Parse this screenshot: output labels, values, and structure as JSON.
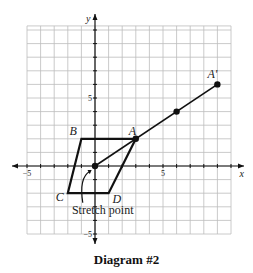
{
  "chart_data": {
    "type": "diagram",
    "title": "Diagram #2",
    "xlabel": "x",
    "ylabel": "y",
    "xlim": [
      -5,
      10
    ],
    "ylim": [
      -5,
      10.3
    ],
    "grid": true,
    "tick_labels": {
      "x": [
        {
          "value": -5,
          "label": "−5"
        },
        {
          "value": 5,
          "label": "5"
        }
      ],
      "y": [
        {
          "value": 5,
          "label": "5"
        },
        {
          "value": -5,
          "label": "−5"
        }
      ]
    },
    "polygon": {
      "name": "ABCD",
      "vertices": [
        {
          "label": "A",
          "x": 3,
          "y": 2
        },
        {
          "label": "B",
          "x": -1,
          "y": 2
        },
        {
          "label": "C",
          "x": -2,
          "y": -2
        },
        {
          "label": "D",
          "x": 1,
          "y": -2
        }
      ]
    },
    "stretch_point": {
      "x": 0,
      "y": 0,
      "label": "Stretch point"
    },
    "ray": {
      "from": {
        "x": 0,
        "y": 0
      },
      "points": [
        {
          "label": "A",
          "x": 3,
          "y": 2
        },
        {
          "label": "",
          "x": 6,
          "y": 4
        },
        {
          "label": "A'",
          "x": 9,
          "y": 6
        }
      ]
    }
  }
}
